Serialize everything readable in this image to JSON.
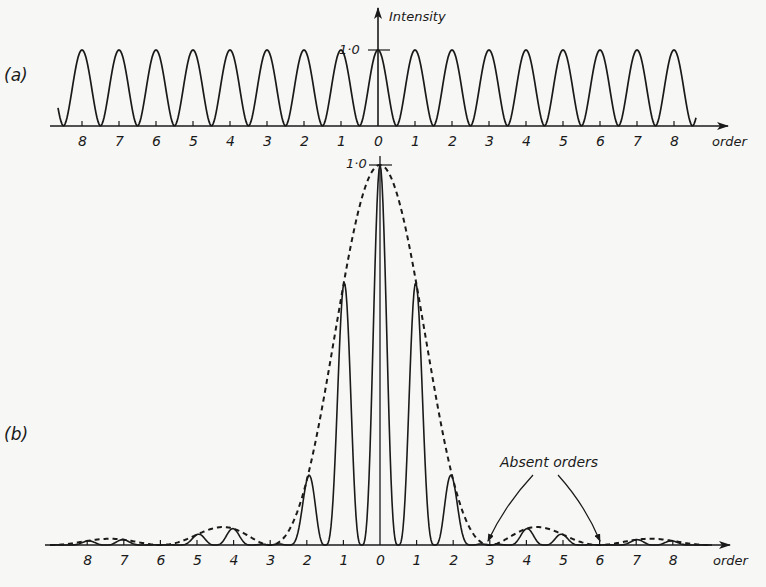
{
  "panel_a": {
    "label": "(a)",
    "y_axis_label": "Intensity",
    "y_tick_label": "1·0",
    "x_axis_label": "order",
    "ticks_left": [
      "8",
      "7",
      "6",
      "5",
      "4",
      "3",
      "2",
      "1"
    ],
    "tick_zero": "0",
    "ticks_right": [
      "1",
      "2",
      "3",
      "4",
      "5",
      "6",
      "7",
      "8"
    ]
  },
  "panel_b": {
    "label": "(b)",
    "y_tick_label": "1·0",
    "x_axis_label": "order",
    "annotation": "Absent orders",
    "ticks_left": [
      "8",
      "7",
      "6",
      "5",
      "4",
      "3",
      "2",
      "1"
    ],
    "tick_zero": "0",
    "ticks_right": [
      "1",
      "2",
      "3",
      "4",
      "5",
      "6",
      "7",
      "8"
    ]
  },
  "colors": {
    "ink": "#1a1a1a",
    "background": "#f7f7f5"
  },
  "chart_data": [
    {
      "type": "line",
      "title": "(a)",
      "xlabel": "order",
      "ylabel": "Intensity",
      "ylim": [
        0,
        1.0
      ],
      "x": [
        -8,
        -7,
        -6,
        -5,
        -4,
        -3,
        -2,
        -1,
        0,
        1,
        2,
        3,
        4,
        5,
        6,
        7,
        8
      ],
      "series": [
        {
          "name": "principal maxima (equal intensity)",
          "values": [
            1,
            1,
            1,
            1,
            1,
            1,
            1,
            1,
            1,
            1,
            1,
            1,
            1,
            1,
            1,
            1,
            1
          ]
        }
      ]
    },
    {
      "type": "line",
      "title": "(b)",
      "xlabel": "order",
      "ylabel": "Intensity",
      "ylim": [
        0,
        1.0
      ],
      "x": [
        -8,
        -7,
        -6,
        -5,
        -4,
        -3,
        -2,
        -1,
        0,
        1,
        2,
        3,
        4,
        5,
        6,
        7,
        8
      ],
      "series": [
        {
          "name": "principal maxima",
          "values": [
            0.02,
            0.03,
            0,
            0.05,
            0.05,
            0,
            0.25,
            0.68,
            1.0,
            0.68,
            0.25,
            0,
            0.05,
            0.05,
            0,
            0.03,
            0.02
          ]
        },
        {
          "name": "single-slit envelope (dashed)",
          "style": "dashed"
        }
      ],
      "annotations": [
        {
          "text": "Absent orders",
          "points_to": [
            3,
            6
          ]
        }
      ]
    }
  ]
}
